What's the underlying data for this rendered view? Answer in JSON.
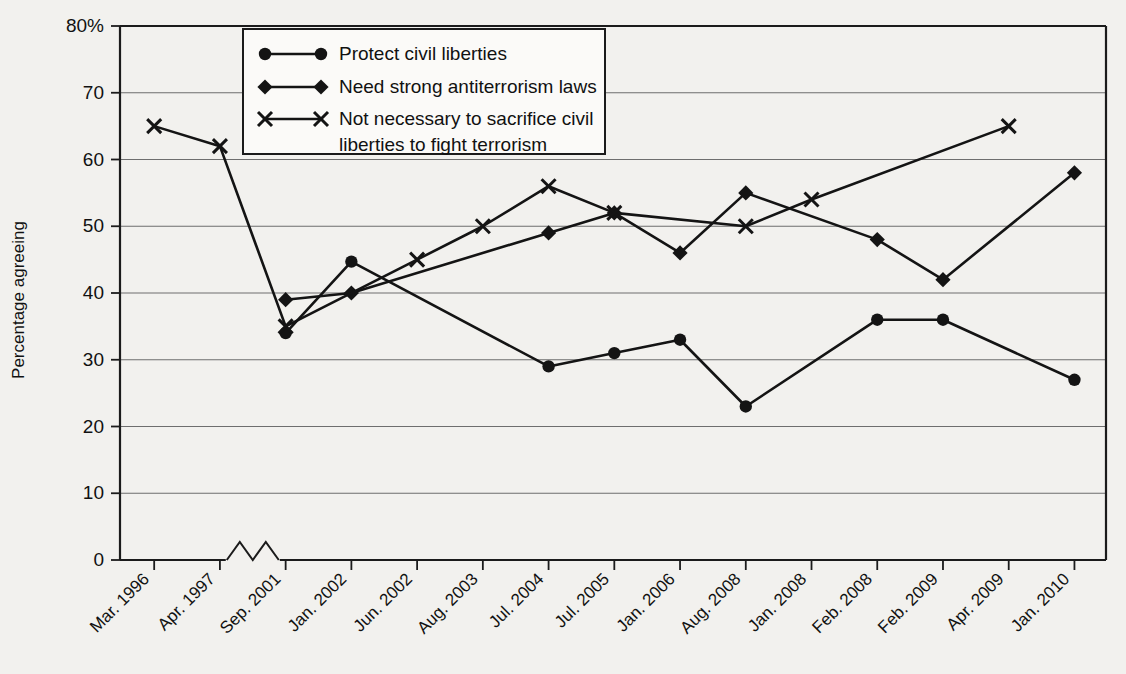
{
  "chart_data": {
    "type": "line",
    "title": "",
    "xlabel": "",
    "ylabel": "Percentage agreeing",
    "ylim": [
      0,
      80
    ],
    "yticks": [
      "0",
      "10",
      "20",
      "30",
      "40",
      "50",
      "60",
      "70",
      "80%"
    ],
    "grid": true,
    "legend_position": "top-center",
    "axis_break": {
      "present": true,
      "between": [
        "Apr. 1997",
        "Sep. 2001"
      ],
      "style": "zigzag"
    },
    "categories": [
      "Mar. 1996",
      "Apr. 1997",
      "Sep. 2001",
      "Jan. 2002",
      "Jun. 2002",
      "Aug. 2003",
      "Jul. 2004",
      "Jul. 2005",
      "Jan. 2006",
      "Aug. 2008",
      "Jan. 2008",
      "Feb. 2008",
      "Feb. 2009",
      "Apr. 2009",
      "Jan. 2010"
    ],
    "series": [
      {
        "name": "Protect civil liberties",
        "marker": "circle",
        "values": [
          null,
          null,
          34,
          44.7,
          null,
          null,
          29,
          31,
          33,
          23,
          null,
          36,
          36,
          null,
          27
        ]
      },
      {
        "name": "Need strong antiterrorism laws",
        "marker": "diamond",
        "values": [
          null,
          null,
          39,
          40,
          null,
          null,
          49,
          52,
          46,
          55,
          null,
          48,
          42,
          null,
          58
        ]
      },
      {
        "name": "Not necessary to sacrifice civil liberties to fight terrorism",
        "marker": "x",
        "values": [
          65,
          62,
          35,
          null,
          45,
          50,
          56,
          52,
          null,
          50,
          54,
          null,
          null,
          65,
          null
        ]
      }
    ]
  },
  "legend": {
    "entries": [
      {
        "label": "Protect civil liberties",
        "marker": "circle"
      },
      {
        "label": "Need strong antiterrorism laws",
        "marker": "diamond"
      },
      {
        "label": "Not necessary to sacrifice civil",
        "marker": "x"
      },
      {
        "label": "liberties to fight terrorism",
        "marker": "none"
      }
    ]
  },
  "colors": {
    "ink": "#141414",
    "grid": "#6e6e6e",
    "background": "#f2f1ee",
    "legend_background": "#fbfaf8"
  }
}
